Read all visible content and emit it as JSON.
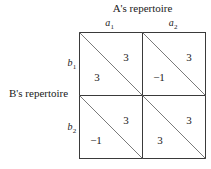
{
  "figure": {
    "type": "payoff-matrix",
    "column_header": "A's repertoire",
    "row_header": "B's repertoire",
    "column_labels": [
      {
        "base": "a",
        "sub": "1"
      },
      {
        "base": "a",
        "sub": "2"
      }
    ],
    "row_labels": [
      {
        "base": "b",
        "sub": "1"
      },
      {
        "base": "b",
        "sub": "2"
      }
    ],
    "cells": [
      {
        "row": "b1",
        "col": "a1",
        "upper_right_value": "3",
        "lower_left_value": "3"
      },
      {
        "row": "b1",
        "col": "a2",
        "upper_right_value": "3",
        "lower_left_value": "−1"
      },
      {
        "row": "b2",
        "col": "a1",
        "upper_right_value": "3",
        "lower_left_value": "−1"
      },
      {
        "row": "b2",
        "col": "a2",
        "upper_right_value": "3",
        "lower_left_value": "3"
      }
    ],
    "colors": {
      "background": "#ffffff",
      "line": "#3a3a3a",
      "diagonal": "#6b6b6b",
      "text": "#1a1a1a"
    }
  }
}
